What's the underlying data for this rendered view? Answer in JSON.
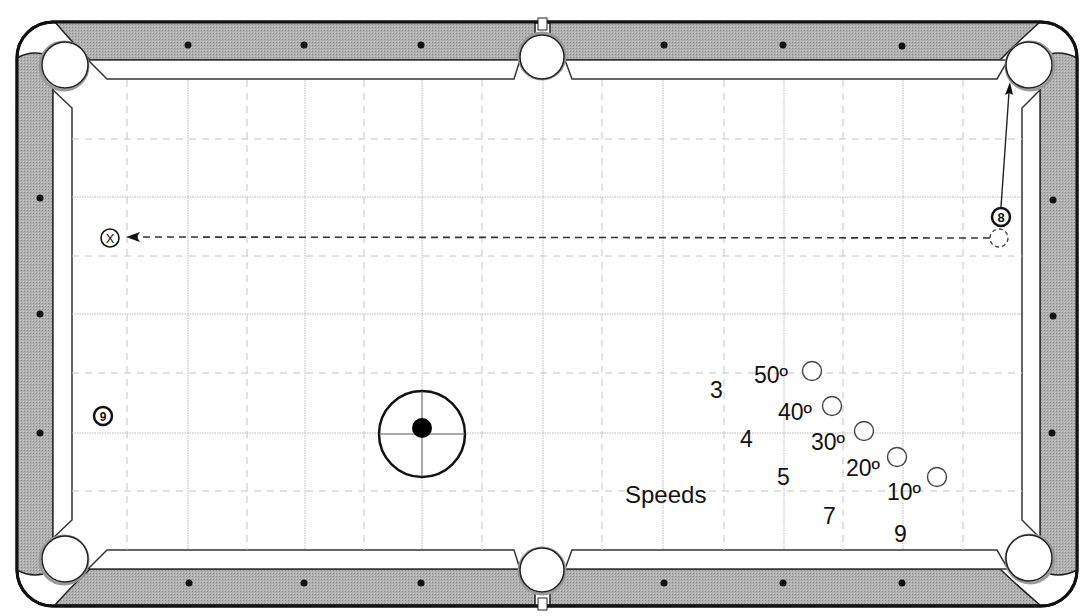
{
  "diagram": {
    "type": "pool-table-shot-diagram",
    "colors": {
      "rail": "#a9a9a9",
      "rail_outline": "#1a1a1a",
      "cloth": "#ffffff",
      "grid_solid": "#b5b5b5",
      "grid_dashed": "#c4c4c4",
      "ink": "#111111"
    },
    "table": {
      "pockets": [
        "top-left",
        "top-middle",
        "top-right",
        "bottom-left",
        "bottom-middle",
        "bottom-right"
      ],
      "diamonds_per_long_rail_half": 3,
      "diamonds_per_short_rail": 3
    },
    "balls": [
      {
        "id": "ball-8",
        "label": "8",
        "position_desc": "near right rail, upper area"
      },
      {
        "id": "ball-9",
        "label": "9",
        "position_desc": "near left rail, lower area"
      },
      {
        "id": "ball-x",
        "label": "X",
        "position_desc": "near left rail, target spot"
      }
    ],
    "cue_ball_diagram": {
      "desc": "cue ball with crosshairs and tip position dot slightly above center"
    },
    "speeds": {
      "title": "Speeds",
      "values": [
        "3",
        "4",
        "5",
        "7",
        "9"
      ]
    },
    "angles": {
      "values": [
        "50º",
        "40º",
        "30º",
        "20º",
        "10º"
      ]
    }
  }
}
